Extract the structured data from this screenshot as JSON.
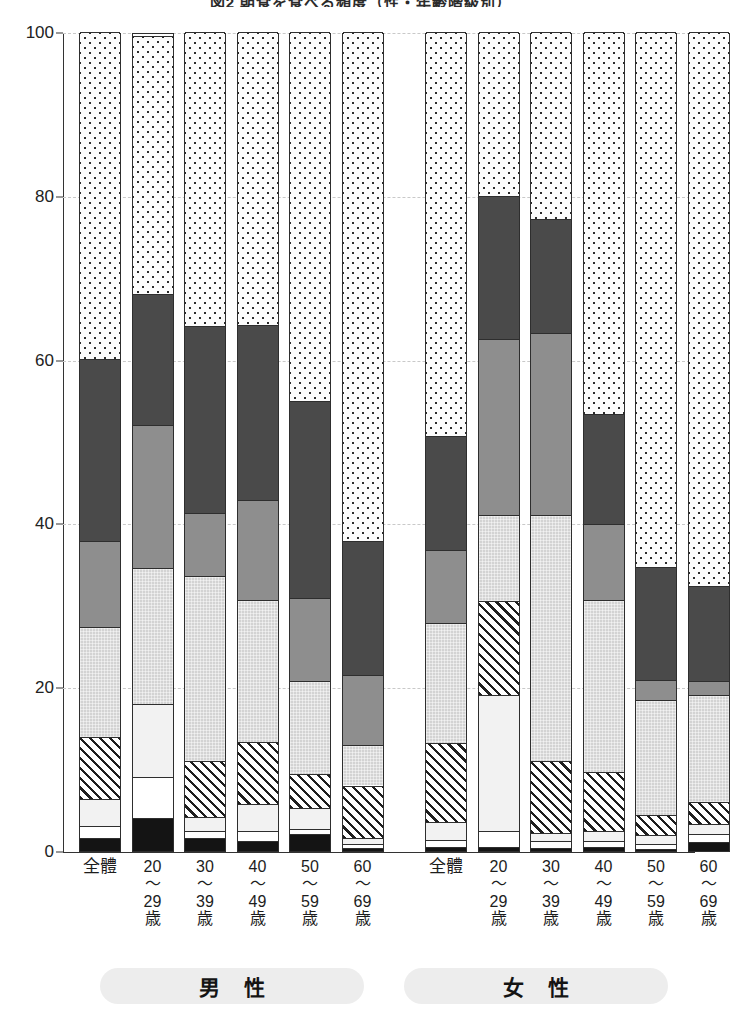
{
  "title": "図2 朝食を食べる頻度（性・年齢階級別）",
  "axis": {
    "unit": "(%)",
    "ticks": [
      "0",
      "20",
      "40",
      "60",
      "80",
      "100"
    ]
  },
  "groups": [
    {
      "id": "male",
      "label": "男 性"
    },
    {
      "id": "female",
      "label": "女 性"
    }
  ],
  "categories": [
    "全體",
    "20\n〜\n29\n歳",
    "30\n〜\n39\n歳",
    "40\n〜\n49\n歳",
    "50\n〜\n59\n歳",
    "60\n〜\n69\n歳",
    "全體",
    "20\n〜\n29\n歳",
    "30\n〜\n39\n歳",
    "40\n〜\n49\n歳",
    "50\n〜\n59\n歳",
    "60\n〜\n69\n歳"
  ],
  "chart_data": {
    "type": "bar",
    "subtype": "stacked-100",
    "title": "図2 朝食を食べる頻度（性・年齢階級別）",
    "xlabel": "",
    "ylabel": "(%)",
    "ylim": [
      0,
      100
    ],
    "yticks": [
      0,
      20,
      40,
      60,
      80,
      100
    ],
    "grid": true,
    "legend": "none-visible",
    "group_labels": [
      "男 性",
      "女 性"
    ],
    "categories": [
      "男性 全體",
      "男性 20〜29歳",
      "男性 30〜39歳",
      "男性 40〜49歳",
      "男性 50〜59歳",
      "男性 60〜69歳",
      "女性 全體",
      "女性 20〜29歳",
      "女性 30〜39歳",
      "女性 40〜49歳",
      "女性 50〜59歳",
      "女性 60〜69歳"
    ],
    "series": [
      {
        "name": "segment-1",
        "pattern": "solid-black",
        "color": "#141414",
        "values": [
          1.6,
          4.0,
          1.6,
          1.2,
          2.1,
          0.4,
          0.5,
          0.5,
          0.4,
          0.5,
          0.3,
          1.1
        ]
      },
      {
        "name": "segment-2",
        "pattern": "solid-white",
        "color": "#ffffff",
        "values": [
          1.5,
          5.0,
          0.9,
          1.2,
          0.6,
          0.4,
          0.8,
          2.0,
          0.8,
          0.7,
          0.5,
          1.0
        ]
      },
      {
        "name": "segment-3",
        "pattern": "pale-dotted",
        "color": "#f2f2f2",
        "values": [
          3.2,
          9.0,
          1.7,
          3.4,
          2.6,
          0.8,
          2.2,
          16.5,
          1.0,
          1.2,
          1.1,
          1.2
        ]
      },
      {
        "name": "segment-4",
        "pattern": "diagonal-hatch",
        "color": "#ffffff",
        "values": [
          7.6,
          0.0,
          6.8,
          7.5,
          4.1,
          6.4,
          9.7,
          11.5,
          8.8,
          7.3,
          2.5,
          2.7
        ]
      },
      {
        "name": "segment-5",
        "pattern": "light-grey",
        "color": "#d3d3d3",
        "values": [
          13.5,
          16.5,
          22.6,
          17.3,
          11.4,
          5.0,
          14.7,
          10.5,
          30.0,
          20.9,
          14.1,
          13.0
        ]
      },
      {
        "name": "segment-6",
        "pattern": "medium-grey",
        "color": "#8e8e8e",
        "values": [
          10.5,
          17.5,
          7.7,
          12.2,
          10.1,
          8.5,
          8.8,
          21.5,
          22.2,
          9.3,
          2.4,
          1.8
        ]
      },
      {
        "name": "segment-7",
        "pattern": "dark-grey",
        "color": "#4a4a4a",
        "values": [
          22.2,
          16.0,
          22.8,
          21.4,
          24.1,
          16.4,
          14.0,
          17.5,
          14.0,
          13.5,
          13.8,
          11.6
        ]
      },
      {
        "name": "segment-8",
        "pattern": "dense-dots",
        "color": "#fbfbfb",
        "values": [
          39.9,
          31.5,
          35.9,
          35.8,
          45.0,
          62.1,
          49.3,
          20.0,
          22.8,
          46.6,
          65.3,
          67.6
        ]
      }
    ],
    "cumulative_tops": {
      "note": "running totals (%) from bottom of each bar, per category",
      "male_total": [
        1.6,
        3.1,
        6.3,
        13.9,
        27.4,
        37.9,
        60.1,
        100
      ],
      "male_20_29": [
        4.0,
        9.0,
        18.0,
        18.0,
        34.5,
        52.0,
        68.0,
        100
      ],
      "male_30_39": [
        1.6,
        2.5,
        4.2,
        11.0,
        33.6,
        41.3,
        64.1,
        100
      ],
      "male_40_49": [
        1.2,
        2.4,
        5.8,
        13.3,
        30.6,
        42.8,
        64.2,
        100
      ],
      "male_50_59": [
        2.1,
        2.7,
        5.3,
        9.4,
        20.8,
        30.9,
        55.0,
        100
      ],
      "male_60_69": [
        0.4,
        0.8,
        1.6,
        8.0,
        13.0,
        21.5,
        37.9,
        100
      ],
      "female_total": [
        0.5,
        1.3,
        3.5,
        13.2,
        27.9,
        36.7,
        50.7,
        100
      ],
      "female_20_29": [
        0.5,
        2.5,
        19.0,
        30.5,
        41.0,
        62.5,
        80.0,
        100
      ],
      "female_30_39": [
        0.4,
        1.2,
        2.2,
        11.0,
        41.0,
        63.2,
        77.2,
        100
      ],
      "female_40_49": [
        0.5,
        1.2,
        2.4,
        9.7,
        30.6,
        39.9,
        53.4,
        100
      ],
      "female_50_59": [
        0.3,
        0.8,
        1.9,
        4.4,
        18.5,
        20.9,
        34.7,
        100
      ],
      "female_60_69": [
        1.1,
        2.1,
        3.3,
        6.0,
        19.0,
        20.8,
        32.4,
        100
      ]
    }
  }
}
